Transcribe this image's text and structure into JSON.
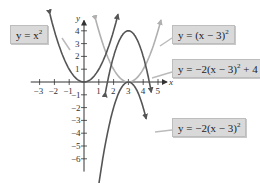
{
  "chart_data": {
    "type": "line",
    "title": "",
    "xlabel": "x",
    "ylabel": "y",
    "xlim": [
      -3.5,
      5.5
    ],
    "ylim": [
      -7,
      4.5
    ],
    "x_ticks": [
      -3,
      -2,
      -1,
      1,
      2,
      3,
      4,
      5
    ],
    "y_ticks": [
      4,
      3,
      2,
      1,
      -1,
      -2,
      -3,
      -4,
      -5,
      -6
    ],
    "grid": false,
    "series": [
      {
        "name": "y = x^2",
        "label": "y = x²",
        "color": "#555555",
        "expr": "x^2",
        "vertex": [
          0,
          0
        ]
      },
      {
        "name": "y = (x - 3)^2",
        "label": "y = (x − 3)²",
        "color": "#b0b0b0",
        "expr": "(x-3)^2",
        "vertex": [
          3,
          0
        ]
      },
      {
        "name": "y = -2(x - 3)^2 + 4",
        "label": "y = −2(x − 3)² + 4",
        "color": "#555555",
        "expr": "-2(x-3)^2+4",
        "vertex": [
          3,
          4
        ]
      },
      {
        "name": "y = -2(x - 3)^2",
        "label": "y = −2(x − 3)²",
        "color": "#555555",
        "expr": "-2(x-3)^2",
        "vertex": [
          3,
          0
        ]
      }
    ]
  },
  "labels": {
    "l1_main": "y = x",
    "l1_sup": "2",
    "l2_main": "y = (x − 3)",
    "l2_sup": "2",
    "l3_main": "y = −2(x − 3)",
    "l3_sup": "2",
    "l3_tail": " + 4",
    "l4_main": "y = −2(x − 3)",
    "l4_sup": "2"
  },
  "axes": {
    "x": "x",
    "y": "y"
  }
}
